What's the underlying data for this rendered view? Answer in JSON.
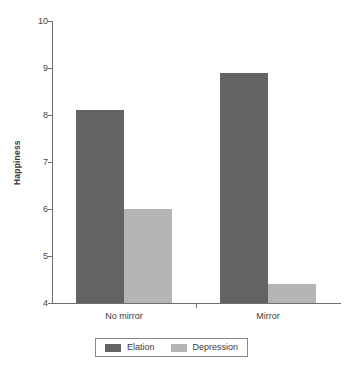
{
  "chart_data": {
    "type": "bar",
    "title": "",
    "xlabel": "",
    "ylabel": "Happiness",
    "categories": [
      "No mirror",
      "Mirror"
    ],
    "series": [
      {
        "name": "Elation",
        "values": [
          8.1,
          8.9
        ],
        "color": "#636363"
      },
      {
        "name": "Depression",
        "values": [
          6.0,
          4.4
        ],
        "color": "#b5b5b5"
      }
    ],
    "ylim": [
      4,
      10
    ],
    "yticks": [
      4,
      5,
      6,
      7,
      8,
      9,
      10
    ],
    "ytick_labels": [
      "4",
      "5",
      "6",
      "7",
      "8",
      "9",
      "10"
    ],
    "grid": false,
    "legend_position": "bottom-center",
    "axis_color": "#6e6e6e",
    "background": "#ffffff"
  },
  "legend": {
    "entries": [
      {
        "label": "Elation"
      },
      {
        "label": "Depression"
      }
    ]
  }
}
